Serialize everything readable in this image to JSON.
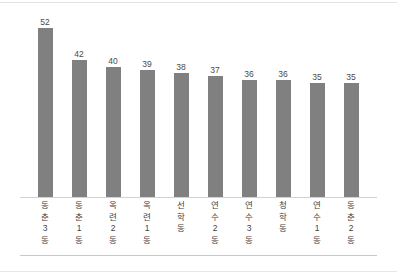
{
  "chart_data": {
    "type": "bar",
    "title": "",
    "subtitle": "",
    "xlabel": "",
    "ylabel": "",
    "ylim": [
      0,
      58
    ],
    "grid": false,
    "legend": "none",
    "orientation": "vertical",
    "bar_color": "#808080",
    "value_label_color": "#4a4a4a",
    "axis_line_color": "#d2d2d2",
    "background": "#ffffff",
    "categories": [
      "동춘3동",
      "동춘1동",
      "옥련2동",
      "옥련1동",
      "선학동",
      "연수2동",
      "연수3동",
      "청학동",
      "연수1동",
      "동춘2동"
    ],
    "values": [
      52,
      42,
      40,
      39,
      38,
      37,
      36,
      36,
      35,
      35
    ],
    "data_labels": [
      "52",
      "42",
      "40",
      "39",
      "38",
      "37",
      "36",
      "36",
      "35",
      "35"
    ]
  }
}
